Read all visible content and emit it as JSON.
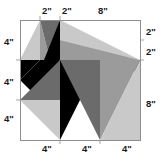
{
  "figure": {
    "frame": {
      "x": 20,
      "y": 20,
      "width": 120,
      "height": 120,
      "units": "inches",
      "pixels_per_unit": 10,
      "total_width_label": "12\"",
      "total_height_label": "12\""
    },
    "colors": {
      "background": "#ffffff",
      "frame_stroke": "#8d8d8d",
      "label_text": "#1a1a1a",
      "black": "#000000",
      "dark_gray": "#6b6b6b",
      "mid_gray": "#9b9b9b",
      "light_gray": "#c9c9c9",
      "pale_gray": "#dcdcdc"
    },
    "labels": {
      "top": [
        {
          "text": "2\"",
          "x": 42,
          "y": 14
        },
        {
          "text": "2\"",
          "x": 62,
          "y": 14
        },
        {
          "text": "8\"",
          "x": 98,
          "y": 14
        }
      ],
      "right": [
        {
          "text": "2\"",
          "x": 146,
          "y": 35
        },
        {
          "text": "2\"",
          "x": 146,
          "y": 55
        },
        {
          "text": "8\"",
          "x": 146,
          "y": 107
        }
      ],
      "bottom": [
        {
          "text": "4\"",
          "x": 42,
          "y": 152
        },
        {
          "text": "4\"",
          "x": 82,
          "y": 152
        },
        {
          "text": "4\"",
          "x": 122,
          "y": 152
        }
      ],
      "left": [
        {
          "text": "4\"",
          "x": 4,
          "y": 45
        },
        {
          "text": "4\"",
          "x": 4,
          "y": 85
        },
        {
          "text": "4\"",
          "x": 4,
          "y": 122
        }
      ]
    },
    "ticks": {
      "top": [
        {
          "x": 40,
          "y1": 16,
          "y2": 20
        },
        {
          "x": 60,
          "y1": 16,
          "y2": 20
        }
      ],
      "right": [
        {
          "y": 40,
          "x1": 140,
          "x2": 144
        },
        {
          "y": 60,
          "x1": 140,
          "x2": 144
        }
      ],
      "bottom": [
        {
          "x": 60,
          "y1": 140,
          "y2": 144
        },
        {
          "x": 100,
          "y1": 140,
          "y2": 144
        }
      ],
      "left": [
        {
          "y": 60,
          "x1": 16,
          "x2": 20
        },
        {
          "y": 100,
          "x1": 16,
          "x2": 20
        }
      ]
    },
    "shapes": [
      {
        "name": "top-left-light-wedge",
        "points": "20,60 40,20 40,60",
        "fill": "#c9c9c9"
      },
      {
        "name": "top-left-mid-wedge",
        "points": "40,20 40,60 50,60",
        "fill": "#9b9b9b"
      },
      {
        "name": "top-left-dark-spike",
        "points": "40,20 60,20 50,60",
        "fill": "#6b6b6b"
      },
      {
        "name": "upper-center-black-spike",
        "points": "60,20 60,60 44,60",
        "fill": "#000000"
      },
      {
        "name": "left-black-wedge",
        "points": "20,60 40,60 20,80",
        "fill": "#000000"
      },
      {
        "name": "left-lower-black-wedge",
        "points": "20,80 40,60 40,100",
        "fill": "#000000"
      },
      {
        "name": "center-left-black-arm",
        "points": "40,60 60,60 40,100",
        "fill": "#000000"
      },
      {
        "name": "top-right-large-light-triangle",
        "points": "60,20 140,60 60,40",
        "fill": "#c9c9c9"
      },
      {
        "name": "top-right-mid-band-triangle",
        "points": "60,40 140,60 60,60",
        "fill": "#9b9b9b"
      },
      {
        "name": "right-upper-black-triangle",
        "points": "60,60 140,60 140,72",
        "fill": "#000000"
      },
      {
        "name": "center-black-downward-arm",
        "points": "60,60 100,60 60,140",
        "fill": "#000000"
      },
      {
        "name": "center-mid-gray-fan",
        "points": "60,60 100,60 100,140",
        "fill": "#6b6b6b"
      },
      {
        "name": "right-lower-dark-triangle",
        "points": "100,60 140,60 100,140",
        "fill": "#9b9b9b"
      },
      {
        "name": "right-lower-light-triangle",
        "points": "100,140 140,60 140,140",
        "fill": "#c9c9c9"
      },
      {
        "name": "lower-left-dark-triangle",
        "points": "20,100 60,60 60,100",
        "fill": "#6b6b6b"
      },
      {
        "name": "lower-left-light-triangle",
        "points": "20,100 60,100 60,140",
        "fill": "#c9c9c9"
      }
    ]
  }
}
